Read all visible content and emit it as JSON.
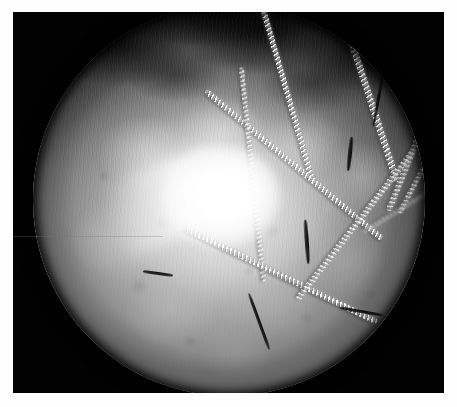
{
  "image": {
    "title": "Arthroscopic endoscope view",
    "modality": "endoscopic-arthroscopy",
    "color_mode": "grayscale",
    "frame": {
      "canvas_width": 457,
      "canvas_height": 407,
      "mount_color": "#fefefe",
      "background_color": "#020202"
    },
    "field_of_view": {
      "shape": "circle",
      "center_x": 235,
      "center_y": 196,
      "radius": 196,
      "rim_color": "#000000"
    },
    "regions": [
      {
        "name": "dark-fibrous-canopy",
        "description": "dark fuzzy villous tissue along the upper arc of the field"
      },
      {
        "name": "bright-tissue-lobes",
        "description": "pale lobulated soft tissue filling the mid and lower field"
      },
      {
        "name": "specular-highlight",
        "description": "saturated white light reflection near the centre"
      },
      {
        "name": "lower-shadowed-tissue",
        "description": "mid-grey mottled tissue toward the inferior rim"
      }
    ],
    "features": [
      {
        "name": "braided-suture",
        "count": 9,
        "description": "white braided cord strands crossing the field diagonally"
      },
      {
        "name": "dark-thread",
        "count": 6,
        "description": "thin dark filaments and debris over the tissue"
      }
    ],
    "colors": {
      "highlight": "#ffffff",
      "tissue_light": "#d8d8d8",
      "tissue_mid": "#9a9a9a",
      "tissue_dark": "#3a3a3a",
      "void": "#000000",
      "mount": "#fefefe"
    },
    "caption": ""
  },
  "sutures": [
    {
      "name": "suture-upper-left-long",
      "left": 120,
      "top": 54,
      "length": 250,
      "thickness": 6.0,
      "angle": 74,
      "class": "bright"
    },
    {
      "name": "suture-upper-mid-long",
      "left": 168,
      "top": 32,
      "length": 300,
      "thickness": 6.5,
      "angle": 72,
      "class": "bright"
    },
    {
      "name": "suture-right-descending",
      "left": 268,
      "top": 74,
      "length": 280,
      "thickness": 6.0,
      "angle": 112,
      "class": "soft"
    },
    {
      "name": "suture-right-outer",
      "left": 300,
      "top": 96,
      "length": 250,
      "thickness": 5.2,
      "angle": 118,
      "class": "soft"
    },
    {
      "name": "suture-center-diagonal",
      "left": 146,
      "top": 158,
      "length": 230,
      "thickness": 6.0,
      "angle": 40,
      "class": "bright"
    },
    {
      "name": "suture-lower-left-vert",
      "left": 112,
      "top": 168,
      "length": 215,
      "thickness": 5.0,
      "angle": 84,
      "class": "soft"
    },
    {
      "name": "suture-lower-cross",
      "left": 140,
      "top": 268,
      "length": 215,
      "thickness": 5.5,
      "angle": 26,
      "class": "bright"
    },
    {
      "name": "suture-lower-right-long",
      "left": 228,
      "top": 218,
      "length": 190,
      "thickness": 5.5,
      "angle": 128,
      "class": "soft"
    },
    {
      "name": "suture-far-right-arc",
      "left": 318,
      "top": 184,
      "length": 160,
      "thickness": 4.5,
      "angle": 148,
      "class": "faint"
    }
  ],
  "dark_strands": [
    {
      "name": "dark-strand-right-upper",
      "left": 318,
      "top": 94,
      "length": 54,
      "thickness": 3.4,
      "angle": 100
    },
    {
      "name": "dark-strand-right-mid",
      "left": 300,
      "top": 148,
      "length": 34,
      "thickness": 3.8,
      "angle": 96
    },
    {
      "name": "dark-strand-center-low",
      "left": 252,
      "top": 236,
      "length": 44,
      "thickness": 3.6,
      "angle": 86
    },
    {
      "name": "dark-strand-lower-mid",
      "left": 196,
      "top": 316,
      "length": 60,
      "thickness": 3.2,
      "angle": 70
    },
    {
      "name": "dark-strand-lower-right",
      "left": 306,
      "top": 306,
      "length": 44,
      "thickness": 3.0,
      "angle": 10
    },
    {
      "name": "dark-strand-left-mid",
      "left": 110,
      "top": 268,
      "length": 30,
      "thickness": 2.6,
      "angle": 8
    }
  ]
}
